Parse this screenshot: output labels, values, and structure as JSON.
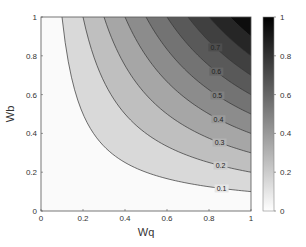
{
  "chart_data": {
    "type": "contour",
    "title": "",
    "xlabel": "Wq",
    "ylabel": "Wb",
    "xlim": [
      0,
      1
    ],
    "ylim": [
      0,
      1
    ],
    "x_ticks": [
      "0",
      "0.2",
      "0.4",
      "0.6",
      "0.8",
      "1"
    ],
    "y_ticks": [
      "0",
      "0.2",
      "0.4",
      "0.6",
      "0.8",
      "1"
    ],
    "function": "z = Wq * Wb",
    "contour_levels": [
      0.1,
      0.2,
      0.3,
      0.4,
      0.5,
      0.6,
      0.7,
      0.8,
      0.9
    ],
    "contour_labels": [
      "0.1",
      "0.2",
      "0.3",
      "0.4",
      "0.5",
      "0.6",
      "0.7"
    ],
    "colormap": "gray (white=0, black=1)",
    "colorbar": {
      "range": [
        0,
        1
      ],
      "ticks": [
        "0",
        "0.2",
        "0.4",
        "0.6",
        "0.8",
        "1"
      ]
    },
    "grid": false,
    "legend": "colorbar right"
  }
}
